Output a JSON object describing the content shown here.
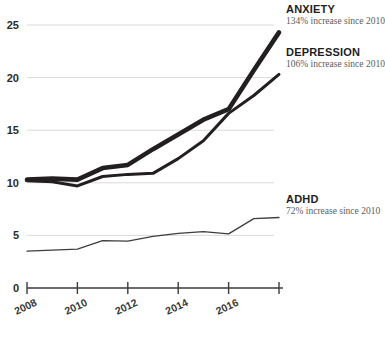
{
  "chart_data": {
    "type": "line",
    "title": "",
    "xlabel": "",
    "ylabel": "",
    "xlim": [
      2008,
      2018
    ],
    "ylim": [
      0,
      25
    ],
    "yticks": [
      0,
      5,
      10,
      15,
      20,
      25
    ],
    "xticks": [
      2008,
      2010,
      2012,
      2014,
      2016,
      2018
    ],
    "xtick_labels": [
      "2008",
      "2010",
      "2012",
      "2014",
      "2016",
      ""
    ],
    "grid": true,
    "legend_position": "right",
    "x": [
      2008,
      2009,
      2010,
      2011,
      2012,
      2013,
      2014,
      2015,
      2016,
      2017,
      2018
    ],
    "series": [
      {
        "name": "ANXIETY",
        "annotation": "134% increase since 2010",
        "color": "#231f20",
        "line_width": 4.6,
        "values": [
          10.3,
          10.4,
          10.3,
          11.4,
          11.7,
          13.2,
          14.6,
          16.0,
          17.0,
          20.7,
          24.3
        ]
      },
      {
        "name": "DEPRESSION",
        "annotation": "106% increase since 2010",
        "color": "#231f20",
        "line_width": 3.0,
        "values": [
          10.2,
          10.1,
          9.7,
          10.6,
          10.8,
          10.9,
          12.3,
          14.0,
          16.6,
          18.3,
          20.3
        ]
      },
      {
        "name": "ADHD",
        "annotation": "72% increase since 2010",
        "color": "#3d3d3d",
        "line_width": 1.3,
        "values": [
          3.5,
          3.6,
          3.7,
          4.5,
          4.45,
          4.9,
          5.2,
          5.35,
          5.15,
          6.6,
          6.7
        ]
      }
    ]
  },
  "legend": {
    "anxiety": {
      "title": "ANXIETY",
      "subtitle": "134% increase since 2010"
    },
    "depression": {
      "title": "DEPRESSION",
      "subtitle": "106% increase since 2010"
    },
    "adhd": {
      "title": "ADHD",
      "subtitle": "72% increase since 2010"
    }
  }
}
